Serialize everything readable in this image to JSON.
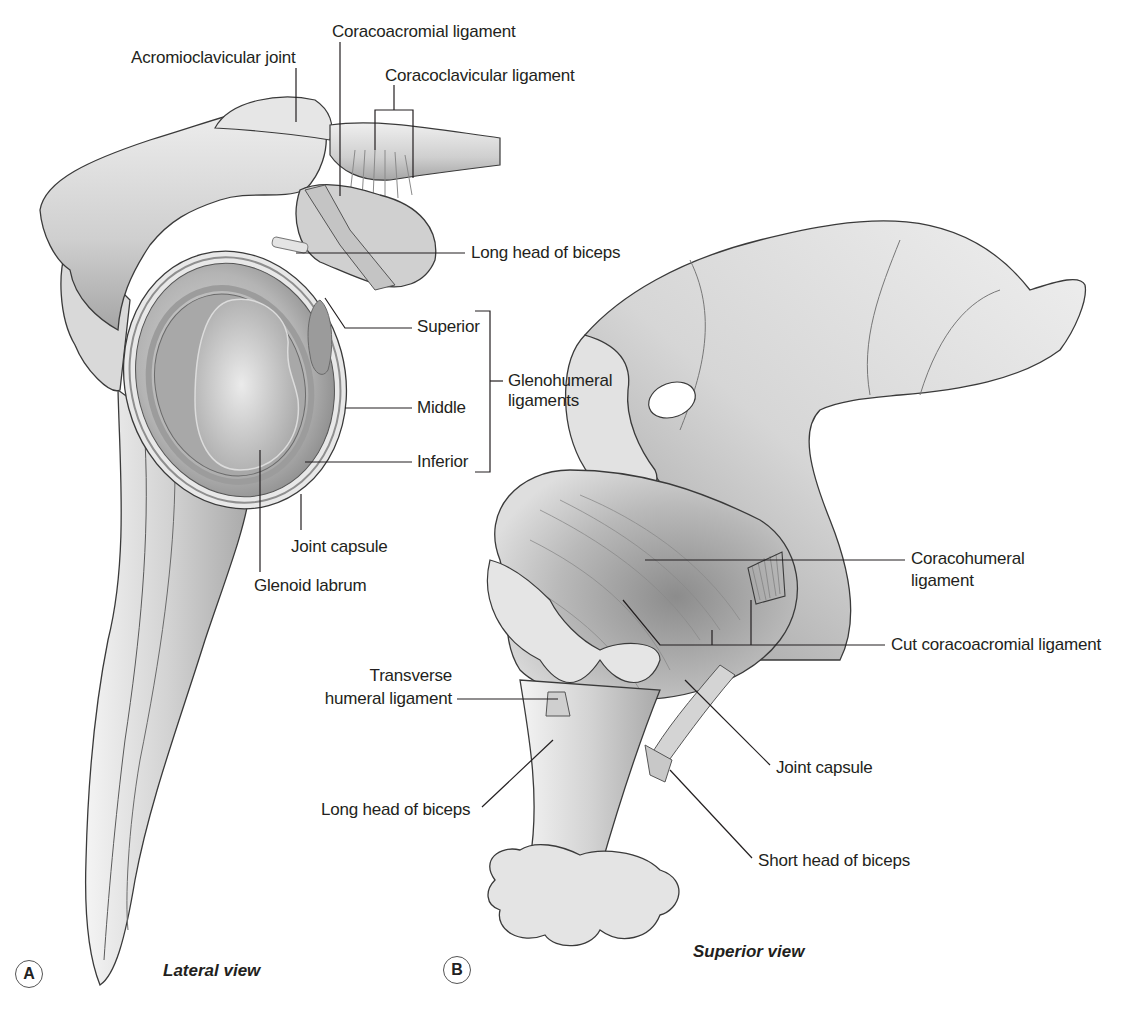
{
  "figure": {
    "panels": [
      {
        "badge": "A",
        "view": "Lateral view",
        "labels": {
          "acromioclavicular_joint": "Acromioclavicular joint",
          "coracoacromial_ligament": "Coracoacromial ligament",
          "coracoclavicular_ligament": "Coracoclavicular ligament",
          "long_head_of_biceps": "Long head of biceps",
          "superior": "Superior",
          "middle": "Middle",
          "inferior": "Inferior",
          "glenohumeral_ligaments_line1": "Glenohumeral",
          "glenohumeral_ligaments_line2": "ligaments",
          "joint_capsule": "Joint capsule",
          "glenoid_labrum": "Glenoid labrum"
        }
      },
      {
        "badge": "B",
        "view": "Superior view",
        "labels": {
          "coracohumeral_ligament_line1": "Coracohumeral",
          "coracohumeral_ligament_line2": "ligament",
          "cut_coracoacromial_ligament": "Cut coracoacromial ligament",
          "transverse_humeral_ligament_line1": "Transverse",
          "transverse_humeral_ligament_line2": "humeral ligament",
          "long_head_of_biceps": "Long head of biceps",
          "joint_capsule": "Joint capsule",
          "short_head_of_biceps": "Short head of biceps"
        }
      }
    ],
    "colors": {
      "background": "#ffffff",
      "bone_light": "#ececec",
      "bone_mid": "#c9c9c9",
      "bone_dark": "#8e8e8e",
      "outline": "#3a3a3a",
      "leader_line": "#231f20",
      "text": "#231f20"
    }
  }
}
